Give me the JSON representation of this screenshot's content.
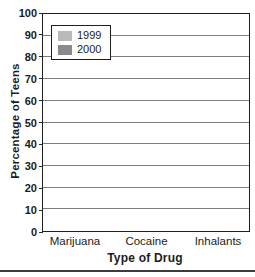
{
  "chart_data": {
    "type": "bar",
    "title": "",
    "categories": [
      "Marijuana",
      "Cocaine",
      "Inhalants"
    ],
    "series": [
      {
        "name": "1999",
        "color": "#b9b9b9",
        "values": [
          53,
          91,
          86
        ]
      },
      {
        "name": "2000",
        "color": "#8a8a8a",
        "values": [
          62,
          93,
          88
        ]
      }
    ],
    "xlabel": "Type of Drug",
    "ylabel": "Percentage of Teens",
    "ylim": [
      0,
      100
    ],
    "ytick_step": 10,
    "yticks": [
      0,
      10,
      20,
      30,
      40,
      50,
      60,
      70,
      80,
      90,
      100
    ],
    "grid": true,
    "legend_position": "top-left",
    "colors": {
      "frame": "#1f1f1f",
      "gridline": "#7d7d7d",
      "text": "#1c1c1c",
      "background": "#ffffff",
      "bottom_rule": "#3c3c3c"
    }
  }
}
